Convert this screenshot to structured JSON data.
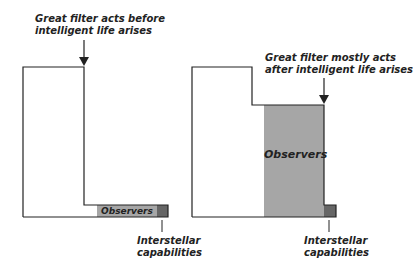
{
  "left_panel": {
    "annotation_top": [
      "Great filter acts before",
      "intelligent life arises"
    ],
    "observers_label": "Observers",
    "annotation_bottom": [
      "Interstellar",
      "capabilities"
    ]
  },
  "right_panel": {
    "annotation_top": [
      "Great filter mostly acts",
      "after intelligent life arises"
    ],
    "observers_label": "Observers",
    "annotation_bottom": [
      "Interstellar",
      "capabilities"
    ]
  },
  "colors": {
    "outline": "#222222",
    "observers_fill": "#a6a6a6",
    "interstellar_fill": "#666666",
    "background": "#ffffff"
  }
}
